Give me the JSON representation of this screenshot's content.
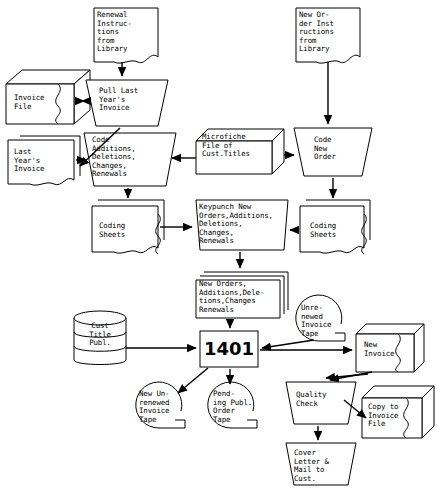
{
  "diagram": {
    "type": "flowchart",
    "nodes": [
      {
        "id": "renewal-instructions",
        "shape": "document",
        "label": "Renewal\nInstruc-\ntions\nfrom\nLibrary",
        "x": 94,
        "y": 8,
        "w": 64,
        "h": 56
      },
      {
        "id": "new-order-instructions",
        "shape": "document",
        "label": "New Or-\nder Inst\nructions\nfrom\nLibrary",
        "x": 296,
        "y": 8,
        "w": 64,
        "h": 56
      },
      {
        "id": "invoice-file",
        "shape": "box3d",
        "label": "Invoice\nFile",
        "x": 6,
        "y": 74,
        "w": 70,
        "h": 48
      },
      {
        "id": "pull-last-years-invoice",
        "shape": "trapezoid",
        "label": "Pull Last\nYear's\nInvoice",
        "x": 88,
        "y": 78,
        "w": 74,
        "h": 46
      },
      {
        "id": "last-years-invoice",
        "shape": "document",
        "label": "Last\nYear's\nInvoice",
        "x": 6,
        "y": 136,
        "w": 66,
        "h": 48
      },
      {
        "id": "code-additions",
        "shape": "trapezoid",
        "label": "Code\nAdditions,\nDeletions,\nChanges,\nRenewals",
        "x": 86,
        "y": 131,
        "w": 84,
        "h": 54
      },
      {
        "id": "microfiche-file",
        "shape": "box3d",
        "label": "Microfiche\nFile of\nCust.Titles",
        "x": 198,
        "y": 129,
        "w": 86,
        "h": 44
      },
      {
        "id": "code-new-order",
        "shape": "trapezoid",
        "label": "Code\nNew\nOrder",
        "x": 296,
        "y": 126,
        "w": 70,
        "h": 48
      },
      {
        "id": "coding-sheets-left",
        "shape": "multidoc",
        "label": "Coding\nSheets",
        "x": 92,
        "y": 201,
        "w": 70,
        "h": 48
      },
      {
        "id": "keypunch",
        "shape": "trapezoid-wide",
        "label": "Keypunch New\nOrders,Additions,\nDeletions,\nChanges,\nRenewals",
        "x": 196,
        "y": 198,
        "w": 90,
        "h": 52
      },
      {
        "id": "coding-sheets-right",
        "shape": "multidoc",
        "label": "Coding\nSheets",
        "x": 300,
        "y": 201,
        "w": 68,
        "h": 48
      },
      {
        "id": "punched-cards",
        "shape": "card-stack",
        "label": "New Orders,\nAdditions,Dele-\ntions,Changes\nRenewals",
        "x": 196,
        "y": 274,
        "w": 84,
        "h": 44
      },
      {
        "id": "cust-title-publ",
        "shape": "cylinder",
        "label": "Cust\nTitle\nPubl.",
        "x": 74,
        "y": 310,
        "w": 52,
        "h": 56
      },
      {
        "id": "computer-1401",
        "shape": "process",
        "label": "1401",
        "x": 200,
        "y": 331,
        "w": 58,
        "h": 34
      },
      {
        "id": "unrenewed-invoice-tape",
        "shape": "tape",
        "label": "Unre-\nnewed\nInvoice\nTape",
        "x": 296,
        "y": 296,
        "w": 46,
        "h": 46
      },
      {
        "id": "new-invoice",
        "shape": "box3d",
        "label": "New\nInvoice",
        "x": 356,
        "y": 327,
        "w": 58,
        "h": 44
      },
      {
        "id": "new-unrenewed-invoice-tape",
        "shape": "tape",
        "label": "New Un-\nrenewed\nInvoice\nTape",
        "x": 136,
        "y": 383,
        "w": 46,
        "h": 46
      },
      {
        "id": "pending-publ-order-tape",
        "shape": "tape",
        "label": "Pend-\ning Publ.\nOrder\nTape",
        "x": 208,
        "y": 383,
        "w": 46,
        "h": 46
      },
      {
        "id": "quality-check",
        "shape": "trapezoid",
        "label": "Quality\nCheck",
        "x": 288,
        "y": 380,
        "w": 64,
        "h": 42
      },
      {
        "id": "copy-to-invoice-file",
        "shape": "box3d",
        "label": "Copy to\nInvoice\nFile",
        "x": 362,
        "y": 390,
        "w": 62,
        "h": 46
      },
      {
        "id": "cover-letter-mail",
        "shape": "trapezoid",
        "label": "Cover\nLetter &\nMail to\nCust.",
        "x": 288,
        "y": 441,
        "w": 64,
        "h": 44
      }
    ],
    "edges": [
      {
        "from": "renewal-instructions",
        "to": "pull-last-years-invoice"
      },
      {
        "from": "invoice-file",
        "to": "pull-last-years-invoice"
      },
      {
        "from": "pull-last-years-invoice",
        "to": "last-years-invoice"
      },
      {
        "from": "last-years-invoice",
        "to": "code-additions"
      },
      {
        "from": "microfiche-file",
        "to": "code-additions"
      },
      {
        "from": "new-order-instructions",
        "to": "code-new-order"
      },
      {
        "from": "microfiche-file",
        "to": "code-new-order"
      },
      {
        "from": "code-additions",
        "to": "coding-sheets-left"
      },
      {
        "from": "code-new-order",
        "to": "coding-sheets-right"
      },
      {
        "from": "coding-sheets-left",
        "to": "keypunch"
      },
      {
        "from": "coding-sheets-right",
        "to": "keypunch"
      },
      {
        "from": "keypunch",
        "to": "punched-cards"
      },
      {
        "from": "punched-cards",
        "to": "computer-1401"
      },
      {
        "from": "cust-title-publ",
        "to": "computer-1401"
      },
      {
        "from": "unrenewed-invoice-tape",
        "to": "computer-1401"
      },
      {
        "from": "computer-1401",
        "to": "new-unrenewed-invoice-tape"
      },
      {
        "from": "computer-1401",
        "to": "pending-publ-order-tape"
      },
      {
        "from": "computer-1401",
        "to": "new-invoice"
      },
      {
        "from": "new-invoice",
        "to": "quality-check"
      },
      {
        "from": "quality-check",
        "to": "copy-to-invoice-file"
      },
      {
        "from": "quality-check",
        "to": "cover-letter-mail"
      }
    ]
  }
}
